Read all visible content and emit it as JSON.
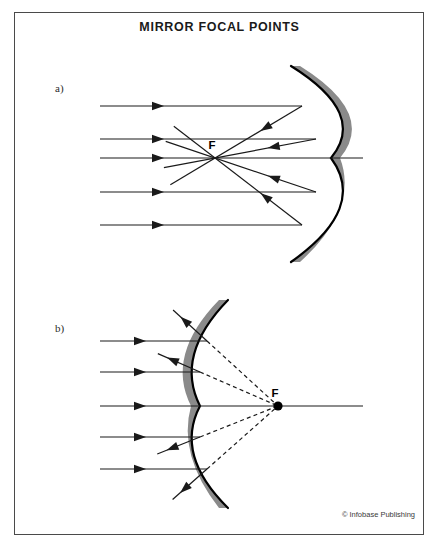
{
  "document": {
    "title": "MIRROR FOCAL POINTS",
    "credit": "© Infobase Publishing",
    "border_color": "#4a4a4a",
    "background": "#ffffff"
  },
  "colors": {
    "mirror_fill": "#8a8a8a",
    "mirror_edge": "#000000",
    "ray": "#1a1a1a",
    "text": "#1a1a1a"
  },
  "panels": [
    {
      "id": "panel-a",
      "label": "a)",
      "mirror_type": "concave",
      "focal_label": "F",
      "focal_point": {
        "x": 215,
        "y": 158
      },
      "focal_point_marked": false,
      "axis": {
        "x1": 100,
        "y1": 158,
        "x2": 363,
        "y2": 158
      },
      "incoming_rays_y": [
        106,
        139,
        158,
        192,
        225
      ],
      "incoming_ray_x_start": 100,
      "arrowhead_x": 158,
      "mirror": {
        "top": {
          "x": 291,
          "y": 66
        },
        "vertex": {
          "x": 331,
          "y": 158
        },
        "bottom": {
          "x": 291,
          "y": 262
        },
        "thickness": 9
      },
      "reflected_rays": [
        {
          "hit_x": 302,
          "hit_y": 106
        },
        {
          "hit_x": 316,
          "hit_y": 139
        },
        {
          "hit_x": 316,
          "hit_y": 192
        },
        {
          "hit_x": 302,
          "hit_y": 225
        }
      ],
      "overshoot_length": 52,
      "reflected_style": "solid"
    },
    {
      "id": "panel-b",
      "label": "b)",
      "mirror_type": "convex",
      "focal_label": "F",
      "focal_point": {
        "x": 278,
        "y": 406
      },
      "focal_point_marked": true,
      "axis": {
        "x1": 100,
        "y1": 406,
        "x2": 363,
        "y2": 406
      },
      "incoming_rays_y": [
        341,
        372,
        406,
        437,
        469
      ],
      "incoming_ray_x_start": 100,
      "arrowhead_x": 140,
      "mirror": {
        "top": {
          "x": 228,
          "y": 300
        },
        "vertex": {
          "x": 200,
          "y": 406
        },
        "bottom": {
          "x": 228,
          "y": 508
        },
        "thickness": 9
      },
      "reflected_rays": [
        {
          "hit_x": 207,
          "hit_y": 341
        },
        {
          "hit_x": 200,
          "hit_y": 372
        },
        {
          "hit_x": 200,
          "hit_y": 437
        },
        {
          "hit_x": 207,
          "hit_y": 469
        }
      ],
      "reflected_style": "solid",
      "virtual_ray_style": "dashed"
    }
  ]
}
